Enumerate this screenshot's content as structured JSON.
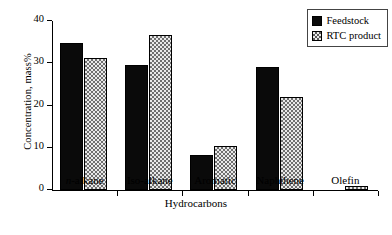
{
  "chart_data": {
    "type": "bar",
    "title": "",
    "xlabel": "Hydrocarbons",
    "ylabel": "Concentration, mass%",
    "categories": [
      "n-alkane",
      "Iso-alkane",
      "Aromatic",
      "Naphthene",
      "Olefin"
    ],
    "category_labels_html": [
      "<i>n</i>-alkane",
      "Iso-alkane",
      "Aromatic",
      "Naphthene",
      "Olefin"
    ],
    "series": [
      {
        "name": "Feedstock",
        "values": [
          34.8,
          29.5,
          8.2,
          29.1,
          0.0
        ]
      },
      {
        "name": "RTC product",
        "values": [
          31.2,
          36.7,
          10.3,
          21.9,
          1.0
        ]
      }
    ],
    "ylim": [
      0,
      40
    ],
    "yticks": [
      0,
      10,
      20,
      30,
      40
    ],
    "ytick_labels": [
      "0",
      "10",
      "20",
      "30",
      "40"
    ],
    "grid": false,
    "legend_position": "top-right",
    "colors": {
      "feedstock": "#0a0a0a",
      "rtc_product": "#e9e9e9",
      "axis": "#000000",
      "background": "#ffffff"
    }
  },
  "legend": {
    "items": [
      {
        "label": "Feedstock",
        "pattern": "solid-black"
      },
      {
        "label": "RTC product",
        "pattern": "dotted-checker"
      }
    ]
  }
}
